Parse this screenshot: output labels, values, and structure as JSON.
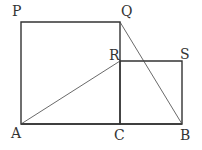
{
  "diagram": {
    "points": {
      "A": {
        "label": "A",
        "x": 21,
        "y": 124
      },
      "C": {
        "label": "C",
        "x": 120,
        "y": 124
      },
      "B": {
        "label": "B",
        "x": 182,
        "y": 124
      },
      "P": {
        "label": "P",
        "x": 21,
        "y": 22
      },
      "Q": {
        "label": "Q",
        "x": 120,
        "y": 22
      },
      "R": {
        "label": "R",
        "x": 120,
        "y": 61
      },
      "S": {
        "label": "S",
        "x": 182,
        "y": 61
      }
    },
    "shapes": [
      {
        "name": "square-APQC",
        "vertices": [
          "A",
          "P",
          "Q",
          "C"
        ]
      },
      {
        "name": "square-CRSB",
        "vertices": [
          "C",
          "R",
          "S",
          "B"
        ]
      }
    ],
    "segments": [
      {
        "name": "segment-AR",
        "from": "A",
        "to": "R"
      },
      {
        "name": "segment-QB",
        "from": "Q",
        "to": "B"
      }
    ],
    "colors": {
      "stroke": "#333333",
      "background": "#ffffff"
    }
  }
}
